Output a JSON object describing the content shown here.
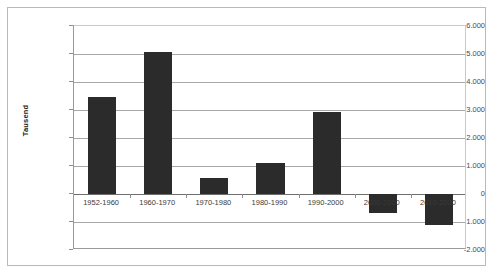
{
  "chart_data": {
    "type": "bar",
    "title": "",
    "subtitle": "",
    "xlabel": "",
    "ylabel": "Tausend",
    "categories": [
      "1952-1960",
      "1960-1970",
      "1970-1980",
      "1980-1990",
      "1990-2000",
      "2000-2010",
      "2010-2020"
    ],
    "values": [
      3480,
      5060,
      580,
      1110,
      2930,
      -690,
      -1110
    ],
    "series": [
      {
        "name": "",
        "values": [
          3480,
          5060,
          580,
          1110,
          2930,
          -690,
          -1110
        ]
      }
    ],
    "ylim": [
      -2000,
      6000
    ],
    "ytick_values": [
      6000,
      5000,
      4000,
      3000,
      2000,
      1000,
      0,
      -1000,
      -2000
    ],
    "ytick_labels": [
      "6.000",
      "5.000",
      "4.000",
      "3.000",
      "2.000",
      "1.000",
      "0",
      "-1.000",
      "-2.000"
    ],
    "grid": true,
    "legend": "none",
    "bar_color": "#2b2b2b",
    "gridline_color": "#a8a8a8",
    "axis_color": "#9a9a9a",
    "background_color": "#ffffff",
    "border_color": "#b9b9b9"
  }
}
